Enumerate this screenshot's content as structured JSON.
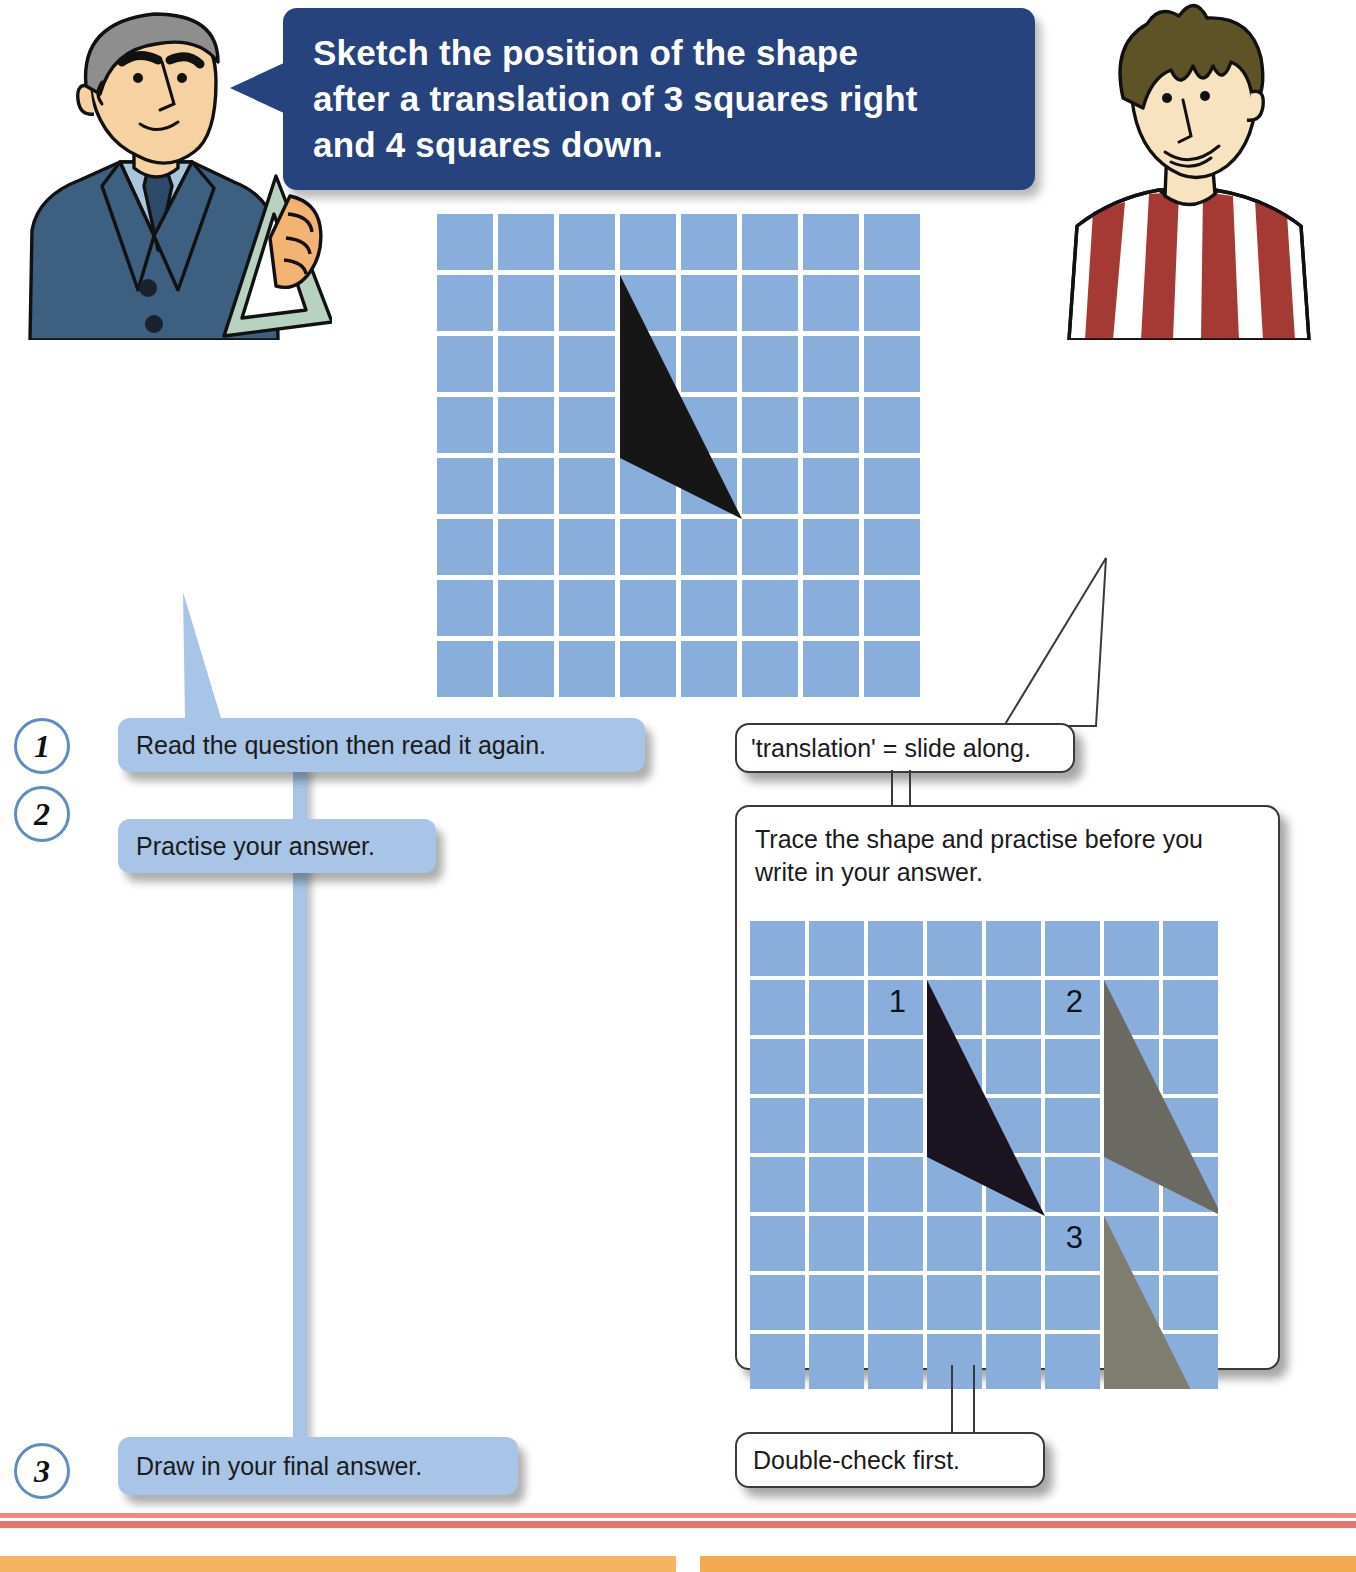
{
  "question": {
    "text": "Sketch the position of the shape\nafter a translation of 3 squares right\nand 4 squares down.",
    "bubble_color": "#27437e",
    "text_color": "#ffffff"
  },
  "characters": {
    "teacher": {
      "name": "teacher-with-set-square",
      "hair_color": "#8e8e8e",
      "suit_color": "#3d5f80",
      "skin_color": "#f6d2a3"
    },
    "student": {
      "name": "student-in-striped-shirt",
      "hair_color": "#5e5326",
      "shirt_stripes": [
        "#a53a34",
        "#ffffff"
      ],
      "skin_color": "#f7e3c0"
    }
  },
  "grids": {
    "main": {
      "cols": 8,
      "rows": 8,
      "cell": 56,
      "gap": 5,
      "cell_color": "#8aaedb",
      "line_color": "#ffffff",
      "shapes": [
        {
          "label": "",
          "fill": "#161616",
          "points": "3.0,1.0 3.0,4.0 5.0,5.0"
        }
      ]
    },
    "practice": {
      "cols": 8,
      "rows": 8,
      "cell": 55,
      "gap": 4,
      "cell_color": "#8aaedb",
      "line_color": "#ffffff",
      "shapes": [
        {
          "label": "1",
          "fill": "#1a1420",
          "points": "3.0,1.0 3.0,4.0 5.0,5.0",
          "label_x": 2.35,
          "label_y": 1.55
        },
        {
          "label": "2",
          "fill": "#6a6962",
          "points": "6.0,1.0 6.0,4.0 8.0,5.0",
          "label_x": 5.35,
          "label_y": 1.55
        },
        {
          "label": "3",
          "fill": "#7f7c70",
          "points": "6.0,5.0 6.0,8.0 8.0,9.0",
          "label_x": 5.35,
          "label_y": 5.55
        }
      ]
    }
  },
  "steps": [
    {
      "number": "1",
      "label": "Read the question then read it again."
    },
    {
      "number": "2",
      "label": "Practise your answer."
    },
    {
      "number": "3",
      "label": "Draw in your final answer."
    }
  ],
  "tips": {
    "translation": "'translation' = slide along.",
    "trace": "Trace the shape and practise before you write in your answer.",
    "double_check": "Double-check first."
  },
  "colors": {
    "blue_box": "#a8c4e6",
    "grid_blue": "#8aaedb",
    "navy": "#27437e",
    "step_circle_border": "#5d8dc4",
    "rule_red": "#e8736a",
    "rule_orange": "#f5b461"
  },
  "chart_data": {
    "type": "table",
    "categories": [
      "original",
      "step 1",
      "step 2",
      "step 3"
    ],
    "values": [
      0,
      1,
      2,
      3
    ],
    "xlabel": "squares right",
    "ylabel": "squares down",
    "annotations": [
      "3 squares right",
      "4 squares down"
    ]
  }
}
